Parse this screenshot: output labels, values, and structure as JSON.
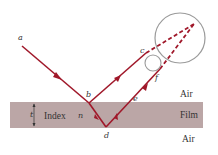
{
  "diagram": {
    "type": "thin-film-interference",
    "colors": {
      "ray": "#a0182a",
      "film": "#bba6a6",
      "circle": "#9a9a9a",
      "text": "#333333"
    },
    "points": {
      "a": "a",
      "b": "b",
      "c": "c",
      "d": "d",
      "e": "e",
      "f": "f"
    },
    "film_label": "Index",
    "index_symbol": "n",
    "thickness_symbol": "t",
    "regions": {
      "top": "Air",
      "middle": "Film",
      "bottom": "Air"
    }
  }
}
